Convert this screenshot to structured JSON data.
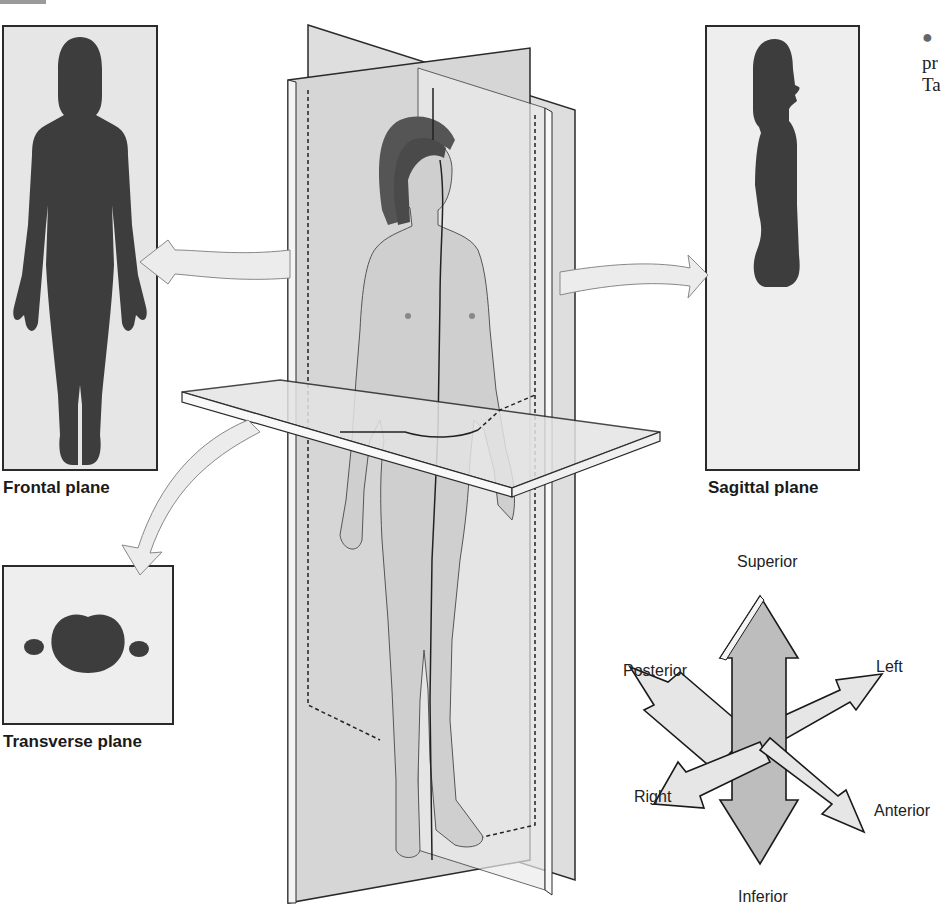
{
  "figure": {
    "planes": [
      {
        "id": "frontal",
        "label": "Frontal plane"
      },
      {
        "id": "sagittal",
        "label": "Sagittal plane"
      },
      {
        "id": "transverse",
        "label": "Transverse plane"
      }
    ],
    "directions": {
      "superior": "Superior",
      "inferior": "Inferior",
      "left": "Left",
      "right": "Right",
      "anterior": "Anterior",
      "posterior": "Posterior"
    },
    "side_text": {
      "bullet": "●",
      "line1": "pr",
      "line2": "Ta"
    },
    "colors": {
      "silhouette": "#3d3d3d",
      "panel_bg": "#e6e6e6",
      "plane_fill": "#dcdcdc",
      "arrow_fill": "#e8e8e8",
      "vertical_arrow_fill": "#bdbdbd",
      "border": "#2a2a2a"
    }
  }
}
